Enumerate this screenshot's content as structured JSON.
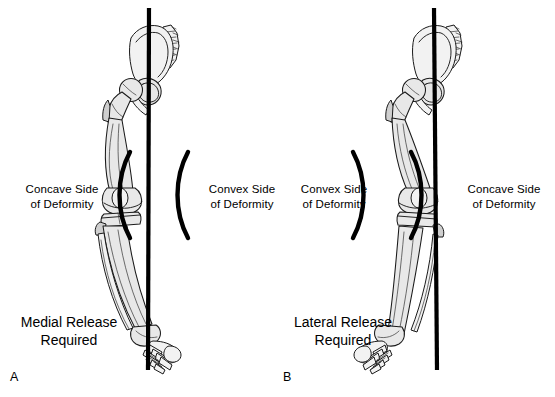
{
  "figure": {
    "background_color": "#ffffff",
    "ink_color": "#000000",
    "bone_fill_color": "#e8e8e8",
    "width": 555,
    "height": 397
  },
  "panels": [
    {
      "letter": "A",
      "deformity": "varus",
      "axis_name": "mechanical-axis-line",
      "left_bracket_label": "Concave Side\nof Deformity",
      "left_bracket_line1": "Concave Side",
      "left_bracket_line2": "of Deformity",
      "left_bracket_shape": "(",
      "right_bracket_line1": "Convex Side",
      "right_bracket_line2": "of Deformity",
      "right_bracket_shape": "(",
      "release_line1": "Medial Release",
      "release_line2": "Required"
    },
    {
      "letter": "B",
      "deformity": "valgus",
      "axis_name": "mechanical-axis-line",
      "left_bracket_label": "Convex Side\nof Deformity",
      "left_bracket_line1": "Convex Side",
      "left_bracket_line2": "of Deformity",
      "left_bracket_shape": ")",
      "right_bracket_line1": "Concave Side",
      "right_bracket_line2": "of Deformity",
      "right_bracket_shape": ")",
      "release_line1": "Lateral Release",
      "release_line2": "Required"
    }
  ],
  "anatomy": {
    "structures": [
      "hemipelvis",
      "sacrum",
      "femoral-head",
      "femoral-neck",
      "greater-trochanter",
      "femur-shaft",
      "femoral-condyles",
      "patella",
      "tibial-plateau",
      "tibia-shaft",
      "fibula",
      "ankle-mortise",
      "tarsals",
      "metatarsals",
      "phalanges"
    ]
  }
}
